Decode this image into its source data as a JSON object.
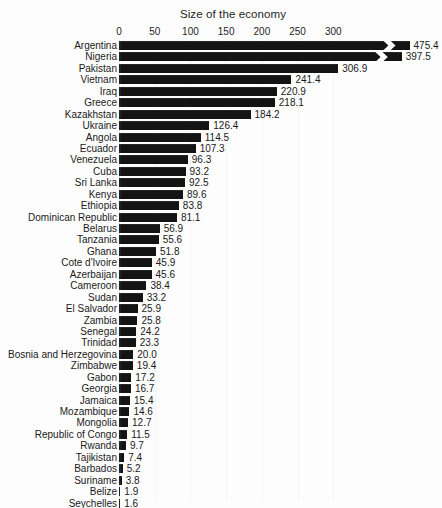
{
  "chart_data": {
    "type": "bar",
    "orientation": "horizontal",
    "title": "Size of the economy",
    "xlabel": "",
    "ylabel": "",
    "xlim": [
      0,
      330
    ],
    "xticks": [
      0,
      50,
      100,
      150,
      200,
      250,
      300
    ],
    "grid": true,
    "legend": null,
    "axis_break": true,
    "axis_break_note": "Bars for Argentina and Nigeria exceed the axis maximum and are drawn with a zig-zag break symbol.",
    "bar_color": "#141414",
    "background_color": "#fdfdfd",
    "categories": [
      "Argentina",
      "Nigeria",
      "Pakistan",
      "Vietnam",
      "Iraq",
      "Greece",
      "Kazakhstan",
      "Ukraine",
      "Angola",
      "Ecuador",
      "Venezuela",
      "Cuba",
      "Sri Lanka",
      "Kenya",
      "Ethiopia",
      "Dominican Republic",
      "Belarus",
      "Tanzania",
      "Ghana",
      "Cote d'Ivoire",
      "Azerbaijan",
      "Cameroon",
      "Sudan",
      "El Salvador",
      "Zambia",
      "Senegal",
      "Trinidad",
      "Bosnia and Herzegovina",
      "Zimbabwe",
      "Gabon",
      "Georgia",
      "Jamaica",
      "Mozambique",
      "Mongolia",
      "Republic of Congo",
      "Rwanda",
      "Tajikistan",
      "Barbados",
      "Suriname",
      "Belize",
      "Seychelles",
      "Grenada"
    ],
    "values": [
      475.4,
      397.5,
      306.9,
      241.4,
      220.9,
      218.1,
      184.2,
      126.4,
      114.5,
      107.3,
      96.3,
      93.2,
      92.5,
      89.6,
      83.8,
      81.1,
      56.9,
      55.6,
      51.8,
      45.9,
      45.6,
      38.4,
      33.2,
      25.9,
      25.8,
      24.2,
      23.3,
      20.0,
      19.4,
      17.2,
      16.7,
      15.4,
      14.6,
      12.7,
      11.5,
      9.7,
      7.4,
      5.2,
      3.8,
      1.9,
      1.6,
      1.2
    ],
    "value_labels": [
      "475.4",
      "397.5",
      "306.9",
      "241.4",
      "220.9",
      "218.1",
      "184.2",
      "126.4",
      "114.5",
      "107.3",
      "96.3",
      "93.2",
      "92.5",
      "89.6",
      "83.8",
      "81.1",
      "56.9",
      "55.6",
      "51.8",
      "45.9",
      "45.6",
      "38.4",
      "33.2",
      "25.9",
      "25.8",
      "24.2",
      "23.3",
      "20.0",
      "19.4",
      "17.2",
      "16.7",
      "15.4",
      "14.6",
      "12.7",
      "11.5",
      "9.7",
      "7.4",
      "5.2",
      "3.8",
      "1.9",
      "1.6",
      "1.2"
    ],
    "tick_labels": [
      "0",
      "50",
      "100",
      "150",
      "200",
      "250",
      "300"
    ]
  }
}
